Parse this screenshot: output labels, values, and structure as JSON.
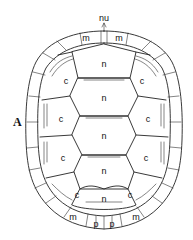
{
  "figure": {
    "panel_label": "A",
    "annotation_top": "nu",
    "labels": {
      "nuchal": "nu",
      "marginal": "m",
      "neural": "n",
      "costal": "c",
      "pygal": "p"
    },
    "marginal_labels": [
      "m",
      "m",
      "m",
      "m"
    ],
    "neural_labels": [
      "n",
      "n",
      "n",
      "n",
      "n"
    ],
    "costal_labels": [
      "c",
      "c",
      "c",
      "c",
      "c",
      "c",
      "c",
      "c"
    ],
    "pygal_labels": [
      "p",
      "p"
    ]
  }
}
